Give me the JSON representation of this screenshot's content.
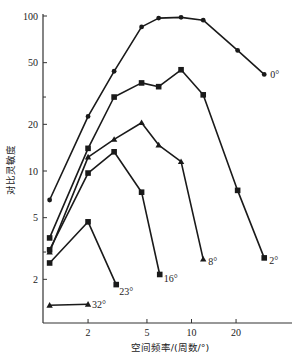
{
  "chart_data": {
    "type": "line",
    "title": "",
    "xlabel": "空间频率/(周数/°)",
    "ylabel": "对比灵敏度",
    "xscale": "log",
    "yscale": "log",
    "xlim": [
      1,
      40
    ],
    "ylim": [
      1.2,
      100
    ],
    "xticks": [
      2,
      5,
      10,
      20
    ],
    "yticks": [
      2,
      5,
      10,
      20,
      50,
      100
    ],
    "grid": false,
    "legend": "inline labels at line ends",
    "series": [
      {
        "name": "0°",
        "marker": "circle",
        "x": [
          1.1,
          2,
          3,
          4.6,
          6,
          8.5,
          12,
          20.5,
          31
        ],
        "y": [
          6.5,
          22.5,
          44,
          85,
          97,
          98,
          94,
          60,
          42
        ]
      },
      {
        "name": "2°",
        "marker": "square",
        "x": [
          1.1,
          2,
          3,
          4.6,
          6,
          8.5,
          12,
          20.5,
          31
        ],
        "y": [
          3.7,
          14,
          30,
          37,
          35,
          45,
          31,
          7.5,
          2.75
        ]
      },
      {
        "name": "8°",
        "marker": "triangle",
        "x": [
          1.1,
          2,
          3,
          4.6,
          6,
          8.5,
          12
        ],
        "y": [
          3.0,
          12.3,
          16,
          20.5,
          14.7,
          11.5,
          2.7
        ]
      },
      {
        "name": "16°",
        "marker": "square",
        "x": [
          1.1,
          2,
          3,
          4.6,
          6.1
        ],
        "y": [
          3.1,
          9.7,
          13.3,
          7.3,
          2.15
        ]
      },
      {
        "name": "23°",
        "marker": "square",
        "x": [
          1.1,
          2,
          3.1
        ],
        "y": [
          2.55,
          4.7,
          1.85
        ]
      },
      {
        "name": "32°",
        "marker": "triangle",
        "x": [
          1.1,
          2
        ],
        "y": [
          1.36,
          1.38
        ]
      }
    ]
  },
  "colors": {
    "line": "#1a1a1a",
    "axis": "#333333",
    "background": "#ffffff"
  }
}
